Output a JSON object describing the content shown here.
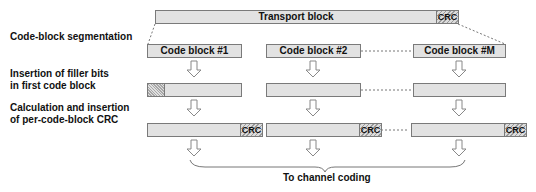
{
  "transport_block": {
    "label": "Transport block",
    "crc_label": "CRC"
  },
  "steps": [
    {
      "line1": "Code-block segmentation",
      "line2": ""
    },
    {
      "line1": "Insertion of filler bits",
      "line2": "in first code block"
    },
    {
      "line1": "Calculation and insertion",
      "line2": "of per-code-block CRC"
    }
  ],
  "code_blocks": [
    {
      "label": "Code block #1"
    },
    {
      "label": "Code block #2"
    },
    {
      "label": "Code block #M"
    }
  ],
  "crc_label": "CRC",
  "output_label": "To channel coding",
  "colors": {
    "block_fill": "#e2e2e2",
    "border": "#7a7a7a",
    "text": "#111111"
  }
}
